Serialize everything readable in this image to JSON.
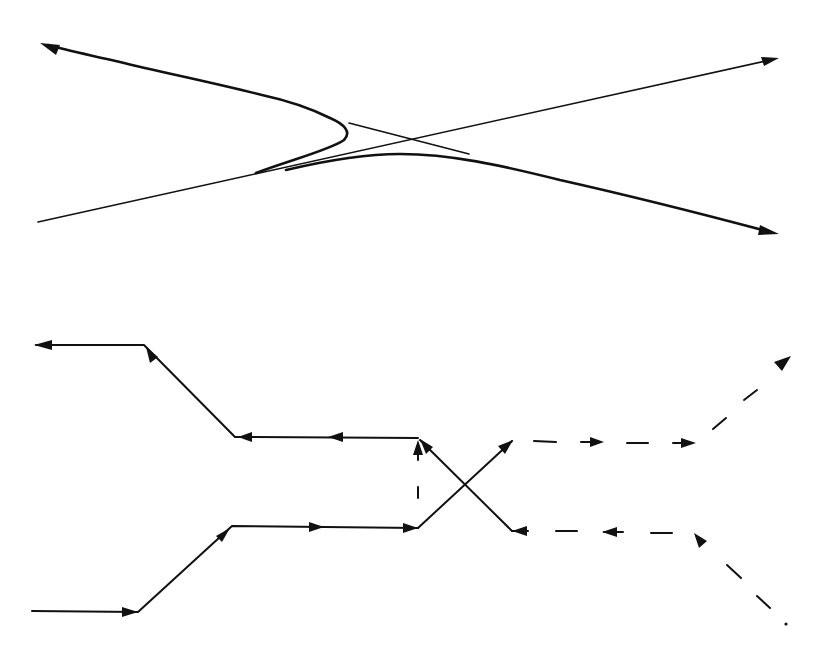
{
  "figure": {
    "panels": [
      {
        "id": "top",
        "description": "Continuous trajectories: two curved paths approaching a crossing of asymptote lines",
        "elements": [
          {
            "name": "asymptote-line-rising",
            "from": [
              38,
              222
            ],
            "to": [
              778,
              58
            ],
            "arrow_end": true
          },
          {
            "name": "asymptote-line-falling-short",
            "from": [
              349,
              123
            ],
            "to": [
              469,
              154
            ],
            "arrow_end": false
          },
          {
            "name": "upper-trajectory",
            "from_turning_point": [
              346,
              138
            ],
            "to": [
              42,
              44
            ],
            "arrow_end": true
          },
          {
            "name": "lower-trajectory",
            "from": [
              285,
              170
            ],
            "to": [
              778,
              234
            ],
            "arrow_end": true
          }
        ]
      },
      {
        "id": "bottom",
        "description": "Piecewise-linear schematic with arrows; solid and dashed segments crossing",
        "elements": [
          {
            "name": "upper-path",
            "points": [
              [
                418,
                438
              ],
              [
                235,
                437
              ],
              [
                144,
                345
              ],
              [
                35,
                345
              ]
            ],
            "arrows": "leftward"
          },
          {
            "name": "lower-path",
            "points": [
              [
                32,
                611
              ],
              [
                138,
                612
              ],
              [
                232,
                526
              ],
              [
                418,
                528
              ]
            ],
            "arrows": "rightward"
          },
          {
            "name": "vertical-dashed-link",
            "from": [
              418,
              508
            ],
            "to": [
              418,
              438
            ],
            "arrow_end": true
          },
          {
            "name": "cross-line-up",
            "from": [
              418,
              528
            ],
            "to": [
              512,
              441
            ],
            "arrow_end": true
          },
          {
            "name": "cross-line-down",
            "from": [
              512,
              531
            ],
            "to": [
              418,
              438
            ],
            "arrow_end": true
          },
          {
            "name": "dashed-upper-right",
            "points": [
              [
                534,
                441
              ],
              [
                696,
                443
              ],
              [
                786,
                356
              ]
            ],
            "arrows": "rightward"
          },
          {
            "name": "dashed-lower-right",
            "points": [
              [
                786,
                625
              ],
              [
                696,
                532
              ],
              [
                512,
                531
              ]
            ],
            "arrows": "leftward"
          }
        ]
      }
    ],
    "colors": {
      "ink": "#111111",
      "background": "#ffffff"
    }
  }
}
